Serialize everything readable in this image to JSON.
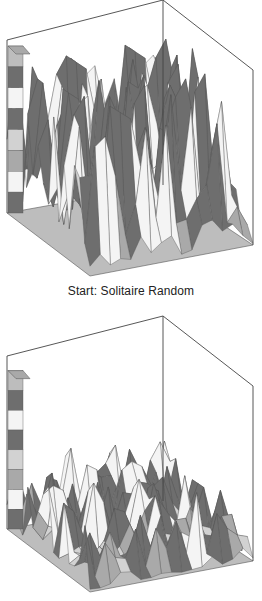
{
  "figure": {
    "caption_top": "Start: Solitaire Random"
  },
  "colors": {
    "band_dark": "#6e6e6e",
    "band_mid": "#a9a9a9",
    "band_light": "#d2d2d2",
    "band_white": "#f4f4f4",
    "floor": "#bdbdbd",
    "edge": "#555555",
    "box": "#444444"
  },
  "chart_data": [
    {
      "type": "surface3d",
      "title": "Start: Solitaire Random",
      "xlabel": "",
      "ylabel": "",
      "zlabel": "",
      "grid": false,
      "description": "3D surface over a square grid with many tall, narrow, spiky peaks of roughly uniform height; a tall ridge in the back-left corner; shaded in horizontal grey/white height bands.",
      "peak_profile_relative_height": [
        0.95,
        0.55,
        0.7,
        0.8,
        0.85,
        0.9,
        0.75,
        0.95,
        1.0,
        0.8,
        0.9,
        0.6,
        0.55,
        0.85,
        0.75,
        0.7,
        0.55,
        0.35
      ],
      "corner_ridge_relative_height": 1.0
    },
    {
      "type": "surface3d",
      "title": "",
      "xlabel": "",
      "ylabel": "",
      "zlabel": "",
      "grid": false,
      "description": "Same 3D surface after evolution: a tall ridge remains in the back-left corner, elsewhere lower, rougher, irregular terrain with short peaks.",
      "peak_profile_relative_height": [
        0.3,
        0.38,
        0.33,
        0.35,
        0.42,
        0.3,
        0.45,
        0.38,
        0.3,
        0.32,
        0.25,
        0.28,
        0.3,
        0.25,
        0.36,
        0.2,
        0.15
      ],
      "corner_ridge_relative_height": 0.95
    }
  ]
}
